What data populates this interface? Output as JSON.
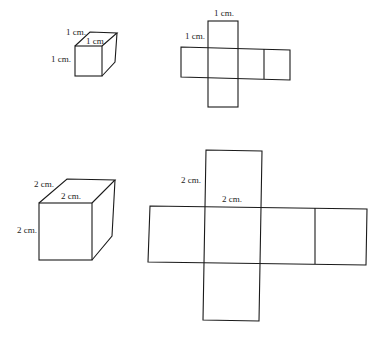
{
  "figure": {
    "small_cube": {
      "labels": {
        "depth": "1 cm.",
        "top": "1 cm.",
        "height": "1 cm."
      }
    },
    "small_net": {
      "labels": {
        "top": "1 cm.",
        "side": "1 cm."
      }
    },
    "large_cube": {
      "labels": {
        "depth": "2 cm.",
        "top": "2 cm.",
        "height": "2 cm."
      }
    },
    "large_net": {
      "labels": {
        "side": "2 cm.",
        "top": "2 cm."
      }
    }
  }
}
